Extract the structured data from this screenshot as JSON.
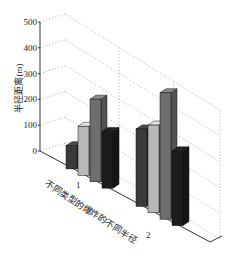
{
  "chart_data": {
    "type": "bar",
    "style": "3d-bar",
    "title": "",
    "xlabel": "不同类型的爆炸的不同半径",
    "ylabel": "半径距离(m)",
    "ylim": [
      0,
      500
    ],
    "yticks": [
      0,
      100,
      200,
      300,
      400,
      500
    ],
    "categories": [
      "1",
      "2"
    ],
    "grid": true,
    "legend": null,
    "series": [
      {
        "name": "series 1",
        "color": "#3a3a3a",
        "values": [
          90,
          300
        ]
      },
      {
        "name": "series 2",
        "color": "#b8b8b8",
        "values": [
          190,
          340
        ]
      },
      {
        "name": "series 3",
        "color": "#6e6e6e",
        "values": [
          320,
          490
        ]
      },
      {
        "name": "series 4",
        "color": "#1c1c1c",
        "values": [
          220,
          290
        ]
      }
    ]
  },
  "labels": {
    "y_ticks": [
      "0",
      "100",
      "200",
      "300",
      "400",
      "500"
    ],
    "x_categories": [
      "1",
      "2"
    ],
    "xlabel": "不同类型的爆炸的不同半径",
    "ylabel": "半径距离(m)"
  }
}
